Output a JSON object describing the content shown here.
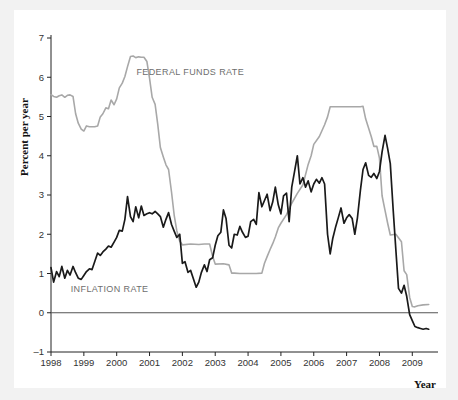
{
  "figure": {
    "background_color": "#f2f2f2",
    "card_color": "#ffffff"
  },
  "chart_data": {
    "type": "line",
    "title": "",
    "xlabel": "Year",
    "ylabel": "Percent per year",
    "xlim": [
      1998,
      2009.6
    ],
    "ylim": [
      -1,
      7
    ],
    "xticks": [
      "1998",
      "1999",
      "2000",
      "2001",
      "2002",
      "2003",
      "2004",
      "2005",
      "2006",
      "2007",
      "2008",
      "2009"
    ],
    "yticks": [
      "7",
      "6",
      "5",
      "4",
      "3",
      "2",
      "1",
      "0",
      "-1"
    ],
    "grid": false,
    "legend_position": "inline-annotations",
    "zero_line": 0,
    "annotations": [
      {
        "text": "FEDERAL FUNDS RATE",
        "x": 2000.6,
        "y": 6.05,
        "color": "#6e6e6e"
      },
      {
        "text": "INFLATION RATE",
        "x": 1998.6,
        "y": 0.52,
        "color": "#6e6e6e"
      }
    ],
    "series": [
      {
        "name": "FEDERAL FUNDS RATE",
        "color": "#a8a8a8",
        "width": 1.6,
        "x": [
          1998.0,
          1998.08,
          1998.17,
          1998.25,
          1998.33,
          1998.42,
          1998.5,
          1998.58,
          1998.67,
          1998.75,
          1998.83,
          1998.92,
          1999.0,
          1999.08,
          1999.17,
          1999.25,
          1999.33,
          1999.42,
          1999.5,
          1999.58,
          1999.67,
          1999.75,
          1999.83,
          1999.92,
          2000.0,
          2000.08,
          2000.17,
          2000.25,
          2000.33,
          2000.42,
          2000.5,
          2000.58,
          2000.67,
          2000.75,
          2000.83,
          2000.92,
          2001.0,
          2001.08,
          2001.17,
          2001.25,
          2001.33,
          2001.42,
          2001.5,
          2001.58,
          2001.67,
          2001.75,
          2001.83,
          2001.92,
          2002.0,
          2002.25,
          2002.5,
          2002.67,
          2002.83,
          2002.92,
          2003.0,
          2003.25,
          2003.42,
          2003.5,
          2003.58,
          2003.75,
          2004.0,
          2004.25,
          2004.42,
          2004.5,
          2004.58,
          2004.67,
          2004.75,
          2004.83,
          2004.92,
          2005.0,
          2005.17,
          2005.33,
          2005.5,
          2005.67,
          2005.83,
          2005.92,
          2006.0,
          2006.17,
          2006.33,
          2006.42,
          2006.5,
          2006.67,
          2006.83,
          2007.0,
          2007.25,
          2007.42,
          2007.5,
          2007.58,
          2007.75,
          2007.83,
          2007.92,
          2008.0,
          2008.08,
          2008.17,
          2008.25,
          2008.33,
          2008.5,
          2008.67,
          2008.75,
          2008.83,
          2008.92,
          2009.0,
          2009.08,
          2009.17,
          2009.33,
          2009.5
        ],
        "y": [
          5.56,
          5.51,
          5.49,
          5.53,
          5.55,
          5.49,
          5.54,
          5.55,
          5.51,
          5.07,
          4.83,
          4.68,
          4.63,
          4.76,
          4.74,
          4.74,
          4.74,
          4.76,
          4.99,
          5.07,
          5.22,
          5.2,
          5.42,
          5.3,
          5.45,
          5.73,
          5.85,
          6.02,
          6.27,
          6.53,
          6.54,
          6.5,
          6.52,
          6.51,
          6.51,
          6.4,
          5.98,
          5.49,
          5.31,
          4.8,
          4.21,
          3.97,
          3.77,
          3.65,
          3.07,
          2.49,
          2.09,
          1.82,
          1.73,
          1.75,
          1.74,
          1.75,
          1.75,
          1.44,
          1.24,
          1.25,
          1.22,
          1.01,
          1.01,
          1.0,
          1.0,
          1.0,
          1.01,
          1.26,
          1.43,
          1.61,
          1.76,
          1.93,
          2.16,
          2.28,
          2.5,
          2.79,
          3.04,
          3.26,
          3.78,
          4.0,
          4.29,
          4.49,
          4.79,
          4.99,
          5.25,
          5.25,
          5.25,
          5.25,
          5.25,
          5.25,
          5.26,
          4.94,
          4.49,
          4.24,
          4.24,
          3.94,
          2.98,
          2.61,
          2.28,
          1.98,
          2.0,
          1.81,
          1.07,
          0.97,
          0.39,
          0.16,
          0.15,
          0.18,
          0.2,
          0.21
        ]
      },
      {
        "name": "INFLATION RATE",
        "color": "#1a1a1a",
        "width": 1.7,
        "x": [
          1998.0,
          1998.08,
          1998.17,
          1998.25,
          1998.33,
          1998.42,
          1998.5,
          1998.58,
          1998.67,
          1998.75,
          1998.83,
          1998.92,
          1999.0,
          1999.08,
          1999.17,
          1999.25,
          1999.33,
          1999.42,
          1999.5,
          1999.58,
          1999.67,
          1999.75,
          1999.83,
          1999.92,
          2000.0,
          2000.08,
          2000.17,
          2000.25,
          2000.33,
          2000.42,
          2000.5,
          2000.58,
          2000.67,
          2000.75,
          2000.83,
          2000.92,
          2001.0,
          2001.08,
          2001.17,
          2001.25,
          2001.33,
          2001.42,
          2001.5,
          2001.58,
          2001.67,
          2001.75,
          2001.83,
          2001.92,
          2002.0,
          2002.08,
          2002.17,
          2002.25,
          2002.33,
          2002.42,
          2002.5,
          2002.58,
          2002.67,
          2002.75,
          2002.83,
          2002.92,
          2003.0,
          2003.08,
          2003.17,
          2003.25,
          2003.33,
          2003.42,
          2003.5,
          2003.58,
          2003.67,
          2003.75,
          2003.83,
          2003.92,
          2004.0,
          2004.08,
          2004.17,
          2004.25,
          2004.33,
          2004.42,
          2004.5,
          2004.58,
          2004.67,
          2004.75,
          2004.83,
          2004.92,
          2005.0,
          2005.08,
          2005.17,
          2005.25,
          2005.33,
          2005.42,
          2005.5,
          2005.58,
          2005.67,
          2005.75,
          2005.83,
          2005.92,
          2006.0,
          2006.08,
          2006.17,
          2006.25,
          2006.33,
          2006.42,
          2006.5,
          2006.58,
          2006.67,
          2006.75,
          2006.83,
          2006.92,
          2007.0,
          2007.08,
          2007.17,
          2007.25,
          2007.33,
          2007.42,
          2007.5,
          2007.58,
          2007.67,
          2007.75,
          2007.83,
          2007.92,
          2008.0,
          2008.08,
          2008.17,
          2008.25,
          2008.33,
          2008.42,
          2008.5,
          2008.58,
          2008.67,
          2008.75,
          2008.83,
          2008.92,
          2009.0,
          2009.08,
          2009.17,
          2009.25,
          2009.33,
          2009.42,
          2009.5
        ],
        "y": [
          1.15,
          0.78,
          1.05,
          0.92,
          1.18,
          0.88,
          1.08,
          0.96,
          1.18,
          1.02,
          0.88,
          0.85,
          0.95,
          1.05,
          1.12,
          1.1,
          1.3,
          1.52,
          1.46,
          1.55,
          1.62,
          1.7,
          1.67,
          1.8,
          1.92,
          2.1,
          2.08,
          2.38,
          2.96,
          2.45,
          2.32,
          2.7,
          2.42,
          2.72,
          2.48,
          2.52,
          2.55,
          2.52,
          2.58,
          2.52,
          2.45,
          2.18,
          2.38,
          2.55,
          2.25,
          2.08,
          1.92,
          2.0,
          1.26,
          1.3,
          1.03,
          1.08,
          0.88,
          0.65,
          0.78,
          1.03,
          1.22,
          1.05,
          1.35,
          1.4,
          1.72,
          1.96,
          2.05,
          2.62,
          2.4,
          1.72,
          1.65,
          2.0,
          1.98,
          2.2,
          2.05,
          1.92,
          1.95,
          2.32,
          2.38,
          2.25,
          3.06,
          2.7,
          2.86,
          3.02,
          2.6,
          2.82,
          3.2,
          2.75,
          2.52,
          2.98,
          3.05,
          2.32,
          3.2,
          3.62,
          4.0,
          3.28,
          3.44,
          3.2,
          3.36,
          3.08,
          3.28,
          3.4,
          3.3,
          3.44,
          3.28,
          2.0,
          1.5,
          1.9,
          2.2,
          2.43,
          2.67,
          2.28,
          2.42,
          2.5,
          2.4,
          2.0,
          2.42,
          3.12,
          3.65,
          3.82,
          3.5,
          3.45,
          3.55,
          3.42,
          3.6,
          4.1,
          4.52,
          4.18,
          3.8,
          2.6,
          1.6,
          0.62,
          0.5,
          0.7,
          0.42,
          -0.05,
          -0.2,
          -0.35,
          -0.38,
          -0.4,
          -0.42,
          -0.4,
          -0.42
        ]
      }
    ]
  }
}
